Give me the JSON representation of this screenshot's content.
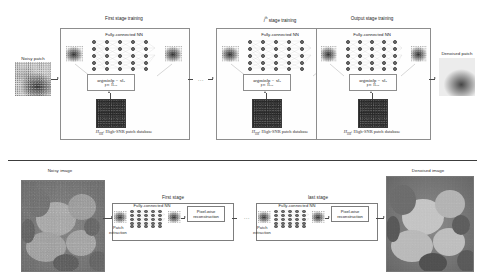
{
  "figure": {
    "accent_color": "#4a4a4a",
    "box_border_color": "#8d8d8d"
  },
  "top_panel": {
    "section_name": "Patch-level multi-stage training",
    "input_label": "Noisy patch",
    "output_label": "Denoised patch",
    "ellipsis": "...",
    "stages": [
      {
        "title": "First stage training",
        "nn_label": "Fully-connected NN",
        "formula_main": "argmin‖p − x‖",
        "formula_sub_norm": "2",
        "formula_constraint": "p ∈ H",
        "formula_constraint_sub": "HR",
        "database_label": "H",
        "database_label_sub": "HR",
        "database_label_rest": ": High-SNR patch database"
      },
      {
        "title": "i th stage training",
        "title_base": "i",
        "title_sup": "th",
        "title_rest": " stage training",
        "nn_label": "Fully-connected NN",
        "formula_main": "argmin‖p − x‖",
        "formula_sub_norm": "2",
        "formula_constraint": "p ∈ H",
        "formula_constraint_sub": "HR",
        "database_label": "H",
        "database_label_sub": "HR",
        "database_label_rest": ": High-SNR patch database"
      },
      {
        "title": "Output stage training",
        "nn_label": "Fully-connected NN",
        "formula_main": "argmin‖p − x‖",
        "formula_sub_norm": "2",
        "formula_constraint": "p ∈ H",
        "formula_constraint_sub": "HR",
        "database_label": "H",
        "database_label_sub": "HR",
        "database_label_rest": ": High-SNR patch database"
      }
    ]
  },
  "bottom_panel": {
    "section_name": "Image-level inference pipeline",
    "input_label": "Noisy image",
    "output_label": "Denoised image",
    "ellipsis": "...",
    "stages": [
      {
        "title": "First stage",
        "nn_label": "Fully-connected NN",
        "extraction_label_1": "Patch",
        "extraction_label_2": "extraction",
        "recon_label": "Pixel-wise reconstruction"
      },
      {
        "title": "last stage",
        "nn_label": "Fully-connected NN",
        "extraction_label_1": "Patch",
        "extraction_label_2": "extraction",
        "recon_label": "Pixel-wise reconstruction"
      }
    ]
  }
}
